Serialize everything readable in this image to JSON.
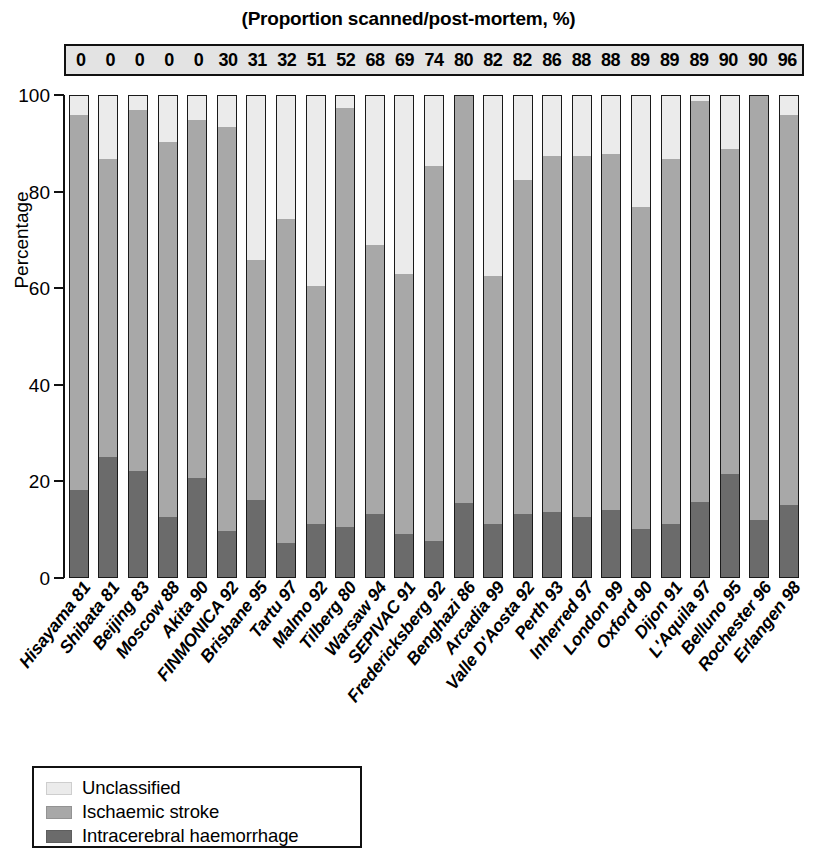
{
  "top_title": "(Proportion scanned/post-mortem, %)",
  "axis": {
    "y_title": "Percentage",
    "y_ticks": [
      "100",
      "80",
      "60",
      "40",
      "20",
      "0"
    ]
  },
  "legend": {
    "items": [
      {
        "label": "Unclassified",
        "color": "#ebebeb"
      },
      {
        "label": "Ischaemic stroke",
        "color": "#a8a8a8"
      },
      {
        "label": "Intracerebral haemorrhage",
        "color": "#6b6b6b"
      }
    ]
  },
  "chart_data": {
    "type": "bar",
    "stacked": true,
    "title": "(Proportion scanned/post-mortem, %)",
    "xlabel": "",
    "ylabel": "Percentage",
    "ylim": [
      0,
      100
    ],
    "yticks": [
      0,
      20,
      40,
      60,
      80,
      100
    ],
    "grid": false,
    "legend_position": "bottom-left",
    "colors": {
      "unclassified": "#ebebeb",
      "ischaemic_stroke": "#a8a8a8",
      "intracerebral_haemorrhage": "#6b6b6b"
    },
    "header_row_label": "(Proportion scanned/post-mortem, %)",
    "categories": [
      "Hisayama 81",
      "Shibata 81",
      "Beijing 83",
      "Moscow 88",
      "Akita 90",
      "FINMONICA 92",
      "Brisbane 95",
      "Tartu 97",
      "Malmo 92",
      "Tilberg 80",
      "Warsaw 94",
      "SEPIVAC 91",
      "Fredericksberg 92",
      "Benghazi 86",
      "Arcadia 99",
      "Valle D'Aosta 92",
      "Perth 93",
      "Inherred 97",
      "London 99",
      "Oxford 90",
      "Dijon 91",
      "L'Aquila 97",
      "Belluno 95",
      "Rochester 96",
      "Erlangen 98"
    ],
    "proportion_scanned": [
      0,
      0,
      0,
      0,
      0,
      30,
      31,
      32,
      51,
      52,
      68,
      69,
      74,
      80,
      82,
      82,
      86,
      88,
      88,
      89,
      89,
      89,
      90,
      90,
      96
    ],
    "series": [
      {
        "name": "Intracerebral haemorrhage",
        "values": [
          18,
          25,
          22,
          12.5,
          20.5,
          9.5,
          16,
          7,
          11,
          10.5,
          13,
          9,
          7.5,
          15.5,
          11,
          13,
          13.5,
          12.5,
          14,
          10,
          11,
          15.5,
          21.5,
          12,
          15
        ]
      },
      {
        "name": "Ischaemic stroke",
        "values": [
          78,
          62,
          75,
          78,
          74.5,
          84,
          50,
          67.5,
          49.5,
          87,
          56,
          54,
          78,
          85,
          51.5,
          69.5,
          74,
          75,
          74,
          67,
          76,
          83.5,
          67.5,
          90,
          81
        ]
      },
      {
        "name": "Unclassified",
        "values": [
          4,
          13,
          3,
          9.5,
          5,
          6.5,
          34,
          25.5,
          39.5,
          2.5,
          31,
          37,
          14.5,
          0,
          37.5,
          17.5,
          12.5,
          12.5,
          12,
          23,
          13,
          1,
          11,
          0,
          4
        ]
      }
    ]
  }
}
